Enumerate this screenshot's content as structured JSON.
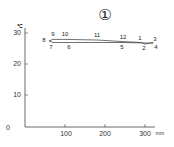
{
  "chart_data": {
    "type": "line",
    "title": "①",
    "xlabel": "mm",
    "ylabel": "℃",
    "xlim": [
      0,
      320
    ],
    "ylim": [
      0,
      30
    ],
    "x_ticks": [
      "100",
      "200",
      "300"
    ],
    "y_ticks": [
      "0",
      "10",
      "20",
      "30"
    ],
    "grid": false,
    "legend": "none",
    "series": [
      {
        "name": "Monthly climate (precipitation vs temperature)",
        "points": [
          {
            "label": "1",
            "x": 290,
            "y": 27.0
          },
          {
            "label": "2",
            "x": 300,
            "y": 26.5
          },
          {
            "label": "3",
            "x": 320,
            "y": 27.0
          },
          {
            "label": "4",
            "x": 320,
            "y": 26.8
          },
          {
            "label": "5",
            "x": 245,
            "y": 27.0
          },
          {
            "label": "6",
            "x": 110,
            "y": 27.0
          },
          {
            "label": "7",
            "x": 70,
            "y": 27.0
          },
          {
            "label": "8",
            "x": 60,
            "y": 27.5
          },
          {
            "label": "9",
            "x": 70,
            "y": 28.0
          },
          {
            "label": "10",
            "x": 100,
            "y": 28.0
          },
          {
            "label": "11",
            "x": 180,
            "y": 27.8
          },
          {
            "label": "12",
            "x": 245,
            "y": 27.3
          }
        ]
      }
    ]
  }
}
